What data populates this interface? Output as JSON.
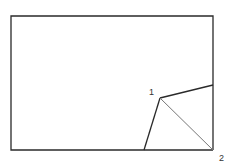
{
  "diagram": {
    "labels": {
      "point1": "1",
      "point2": "2"
    },
    "colors": {
      "outline": "#2a2a2a",
      "fold_crease": "#777777",
      "background": "#ffffff"
    },
    "shapes": {
      "rectangle": {
        "x": 11,
        "y": 16,
        "width": 202,
        "height": 134
      },
      "point1": {
        "x": 160,
        "y": 98
      },
      "point2": {
        "x": 213,
        "y": 150
      },
      "fold_right_end": {
        "x": 213,
        "y": 85
      },
      "fold_bottom_end": {
        "x": 144,
        "y": 150
      }
    }
  }
}
